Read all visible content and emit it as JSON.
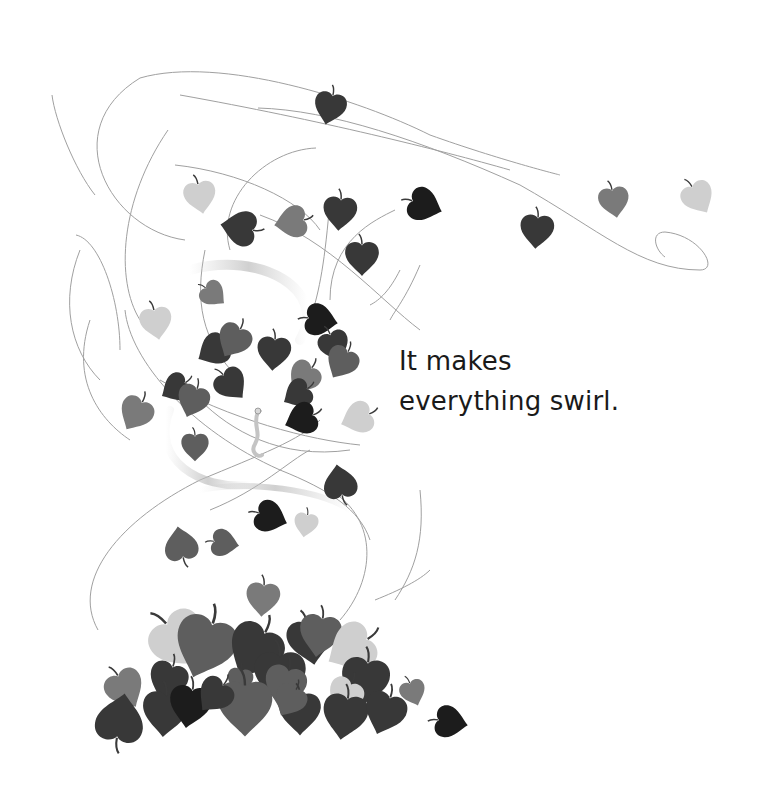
{
  "page": {
    "caption_lines": [
      "It makes",
      "everything swirl."
    ]
  },
  "palette": {
    "background": "#ffffff",
    "text": "#1a1a1a",
    "black_leaf": "#1c1c1c",
    "dark_leaf": "#383838",
    "mid_leaf": "#5e5e5e",
    "gray_leaf": "#7a7a7a",
    "light_leaf": "#cfcfcf",
    "swirl_line": "#9a9a9a",
    "worm": "#bdbdbd"
  },
  "illustration": {
    "subject": "swirling wind carrying leaves",
    "figure": "small worm in the center of the swirl",
    "leaves": [
      {
        "x": 330,
        "y": 107,
        "r": 14,
        "s": 1.0,
        "c": "dark_leaf"
      },
      {
        "x": 200,
        "y": 196,
        "r": -10,
        "s": 1.0,
        "c": "light_leaf"
      },
      {
        "x": 240,
        "y": 228,
        "r": 100,
        "s": 1.1,
        "c": "dark_leaf"
      },
      {
        "x": 292,
        "y": 222,
        "r": 80,
        "s": 1.0,
        "c": "gray_leaf"
      },
      {
        "x": 340,
        "y": 212,
        "r": 5,
        "s": 1.05,
        "c": "dark_leaf"
      },
      {
        "x": 424,
        "y": 205,
        "r": -70,
        "s": 1.05,
        "c": "black_leaf"
      },
      {
        "x": 362,
        "y": 257,
        "r": 0,
        "s": 1.05,
        "c": "dark_leaf"
      },
      {
        "x": 537,
        "y": 230,
        "r": 5,
        "s": 1.05,
        "c": "dark_leaf"
      },
      {
        "x": 614,
        "y": 201,
        "r": -10,
        "s": 0.95,
        "c": "gray_leaf"
      },
      {
        "x": 698,
        "y": 197,
        "r": -30,
        "s": 1.0,
        "c": "light_leaf"
      },
      {
        "x": 213,
        "y": 294,
        "r": -50,
        "s": 0.8,
        "c": "gray_leaf"
      },
      {
        "x": 156,
        "y": 322,
        "r": -10,
        "s": 1.0,
        "c": "light_leaf"
      },
      {
        "x": 320,
        "y": 320,
        "r": -80,
        "s": 1.0,
        "c": "black_leaf"
      },
      {
        "x": 214,
        "y": 350,
        "r": 60,
        "s": 1.0,
        "c": "dark_leaf"
      },
      {
        "x": 234,
        "y": 340,
        "r": 30,
        "s": 1.05,
        "c": "mid_leaf"
      },
      {
        "x": 274,
        "y": 352,
        "r": 5,
        "s": 1.05,
        "c": "dark_leaf"
      },
      {
        "x": 334,
        "y": 345,
        "r": -20,
        "s": 0.95,
        "c": "dark_leaf"
      },
      {
        "x": 342,
        "y": 362,
        "r": 30,
        "s": 1.0,
        "c": "mid_leaf"
      },
      {
        "x": 304,
        "y": 377,
        "r": 40,
        "s": 1.0,
        "c": "gray_leaf"
      },
      {
        "x": 176,
        "y": 388,
        "r": 60,
        "s": 0.9,
        "c": "dark_leaf"
      },
      {
        "x": 193,
        "y": 400,
        "r": 20,
        "s": 1.0,
        "c": "mid_leaf"
      },
      {
        "x": 231,
        "y": 384,
        "r": -40,
        "s": 1.0,
        "c": "dark_leaf"
      },
      {
        "x": 298,
        "y": 394,
        "r": 60,
        "s": 0.9,
        "c": "dark_leaf"
      },
      {
        "x": 302,
        "y": 419,
        "r": 70,
        "s": 1.0,
        "c": "black_leaf"
      },
      {
        "x": 136,
        "y": 413,
        "r": 30,
        "s": 1.05,
        "c": "gray_leaf"
      },
      {
        "x": 358,
        "y": 418,
        "r": 70,
        "s": 1.0,
        "c": "light_leaf"
      },
      {
        "x": 195,
        "y": 446,
        "r": 0,
        "s": 0.85,
        "c": "mid_leaf"
      },
      {
        "x": 340,
        "y": 483,
        "r": 170,
        "s": 1.05,
        "c": "dark_leaf"
      },
      {
        "x": 270,
        "y": 517,
        "r": -70,
        "s": 1.0,
        "c": "black_leaf"
      },
      {
        "x": 306,
        "y": 524,
        "r": 10,
        "s": 0.75,
        "c": "light_leaf"
      },
      {
        "x": 181,
        "y": 545,
        "r": 170,
        "s": 1.05,
        "c": "mid_leaf"
      },
      {
        "x": 224,
        "y": 543,
        "r": -80,
        "s": 0.85,
        "c": "mid_leaf"
      },
      {
        "x": 263,
        "y": 598,
        "r": 5,
        "s": 1.05,
        "c": "gray_leaf"
      },
      {
        "x": 413,
        "y": 692,
        "r": -20,
        "s": 0.8,
        "c": "gray_leaf"
      },
      {
        "x": 450,
        "y": 722,
        "r": -80,
        "s": 1.0,
        "c": "black_leaf"
      }
    ],
    "pile": [
      {
        "x": 180,
        "y": 640,
        "r": -40,
        "s": 1.8,
        "c": "light_leaf"
      },
      {
        "x": 205,
        "y": 645,
        "r": 20,
        "s": 1.9,
        "c": "mid_leaf"
      },
      {
        "x": 255,
        "y": 650,
        "r": 30,
        "s": 1.7,
        "c": "dark_leaf"
      },
      {
        "x": 310,
        "y": 640,
        "r": -10,
        "s": 1.4,
        "c": "dark_leaf"
      },
      {
        "x": 320,
        "y": 634,
        "r": 10,
        "s": 1.3,
        "c": "mid_leaf"
      },
      {
        "x": 352,
        "y": 648,
        "r": 60,
        "s": 1.5,
        "c": "light_leaf"
      },
      {
        "x": 168,
        "y": 680,
        "r": 20,
        "s": 1.2,
        "c": "dark_leaf"
      },
      {
        "x": 125,
        "y": 688,
        "r": -30,
        "s": 1.2,
        "c": "gray_leaf"
      },
      {
        "x": 280,
        "y": 675,
        "r": 0,
        "s": 1.6,
        "c": "dark_leaf"
      },
      {
        "x": 240,
        "y": 680,
        "r": 10,
        "s": 0.8,
        "c": "mid_leaf"
      },
      {
        "x": 285,
        "y": 685,
        "r": 15,
        "s": 1.3,
        "c": "mid_leaf"
      },
      {
        "x": 365,
        "y": 680,
        "r": 10,
        "s": 1.5,
        "c": "dark_leaf"
      },
      {
        "x": 345,
        "y": 695,
        "r": 30,
        "s": 1.1,
        "c": "light_leaf"
      },
      {
        "x": 120,
        "y": 720,
        "r": -170,
        "s": 1.5,
        "c": "dark_leaf"
      },
      {
        "x": 165,
        "y": 712,
        "r": 5,
        "s": 1.4,
        "c": "dark_leaf"
      },
      {
        "x": 190,
        "y": 705,
        "r": 10,
        "s": 1.3,
        "c": "black_leaf"
      },
      {
        "x": 245,
        "y": 706,
        "r": 0,
        "s": 1.7,
        "c": "mid_leaf"
      },
      {
        "x": 300,
        "y": 712,
        "r": 0,
        "s": 1.3,
        "c": "dark_leaf"
      },
      {
        "x": 290,
        "y": 700,
        "r": 30,
        "s": 1.0,
        "c": "mid_leaf"
      },
      {
        "x": 345,
        "y": 715,
        "r": 10,
        "s": 1.4,
        "c": "dark_leaf"
      },
      {
        "x": 385,
        "y": 712,
        "r": 20,
        "s": 1.3,
        "c": "dark_leaf"
      },
      {
        "x": 215,
        "y": 695,
        "r": 40,
        "s": 1.1,
        "c": "dark_leaf"
      }
    ]
  }
}
